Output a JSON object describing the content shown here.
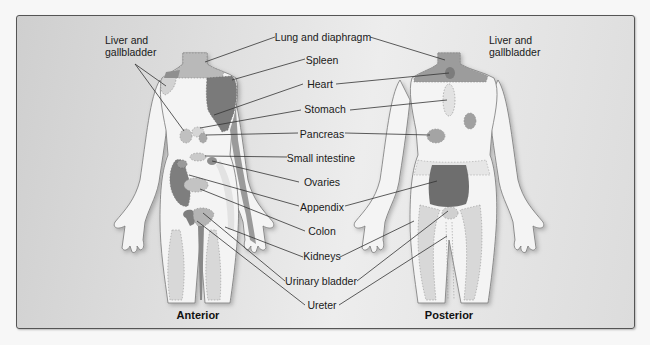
{
  "diagram": {
    "type": "anatomical referred pain map",
    "views": [
      {
        "id": "anterior",
        "title": "Anterior"
      },
      {
        "id": "posterior",
        "title": "Posterior"
      }
    ],
    "labels": {
      "liver_gallbladder_left": "Liver and\ngallbladder",
      "liver_gallbladder_right": "Liver and\ngallbladder",
      "lung_diaphragm": "Lung and diaphragm",
      "spleen": "Spleen",
      "heart": "Heart",
      "stomach": "Stomach",
      "pancreas": "Pancreas",
      "small_intestine": "Small intestine",
      "ovaries": "Ovaries",
      "appendix": "Appendix",
      "colon": "Colon",
      "kidneys": "Kidneys",
      "urinary_bladder": "Urinary bladder",
      "ureter": "Ureter"
    },
    "colors": {
      "body_fill": "#f4f4f4",
      "body_outline": "#777777",
      "light_shade": "#c4c4c4",
      "medium_shade": "#9a9a9a",
      "dark_shade": "#6f6f6f",
      "leader_line": "#333333",
      "frame_border": "#555555"
    }
  }
}
